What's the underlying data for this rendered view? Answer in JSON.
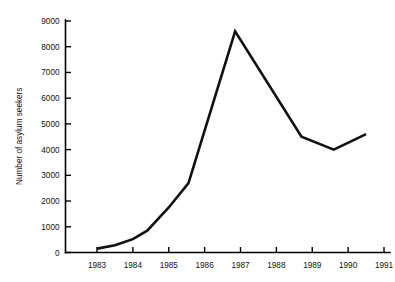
{
  "chart_data": {
    "type": "line",
    "title": "",
    "xlabel": "",
    "ylabel": "Number of asylum seekers",
    "xlim": [
      1982.5,
      1991.2
    ],
    "ylim": [
      0,
      9000
    ],
    "grid": false,
    "legend": "none",
    "x_ticks": [
      "1983",
      "1984",
      "1985",
      "1986",
      "1987",
      "1988",
      "1989",
      "1990",
      "1991"
    ],
    "x_tick_values": [
      1983,
      1984,
      1985,
      1986,
      1987,
      1988,
      1989,
      1990,
      1991
    ],
    "y_ticks": [
      "0",
      "1000",
      "2000",
      "3000",
      "4000",
      "5000",
      "6000",
      "7000",
      "8000",
      "9000"
    ],
    "y_tick_values": [
      0,
      1000,
      2000,
      3000,
      4000,
      5000,
      6000,
      7000,
      8000,
      9000
    ],
    "line_color": "#111111",
    "series": [
      {
        "name": "Asylum seekers",
        "x": [
          1983,
          1983.5,
          1984,
          1984.4,
          1985,
          1985.55,
          1986.85,
          1988.7,
          1989.6,
          1990.5
        ],
        "values": [
          150,
          280,
          520,
          850,
          1750,
          2700,
          8600,
          4500,
          4000,
          4600
        ]
      }
    ]
  }
}
